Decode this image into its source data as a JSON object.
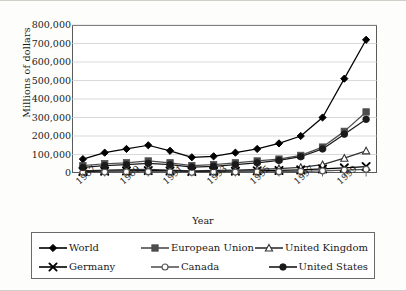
{
  "chart_data": {
    "type": "line",
    "title": "",
    "xlabel": "Year",
    "ylabel": "Millions of dollars",
    "x": [
      1987,
      1988,
      1989,
      1990,
      1991,
      1992,
      1993,
      1994,
      1995,
      1996,
      1997,
      1998,
      1999,
      2000
    ],
    "xtick_labels": [
      "1987",
      "1989",
      "1991",
      "1993",
      "1995",
      "1997",
      "1999"
    ],
    "ytick_labels": [
      "800,000",
      "700,000",
      "600,000",
      "500,000",
      "400,000",
      "300,000",
      "200,000",
      "100,000",
      "0"
    ],
    "ylim": [
      0,
      800000
    ],
    "ytick_step": 100000,
    "grid": "horizontal",
    "legend_position": "below",
    "series": [
      {
        "name": "World",
        "marker": "filled-diamond",
        "color": "#000000",
        "values": [
          75000,
          110000,
          130000,
          150000,
          120000,
          85000,
          90000,
          110000,
          130000,
          160000,
          200000,
          300000,
          510000,
          720000
        ]
      },
      {
        "name": "European Union",
        "marker": "filled-square",
        "color": "#4d4d4d",
        "values": [
          40000,
          50000,
          55000,
          65000,
          55000,
          40000,
          45000,
          55000,
          65000,
          75000,
          95000,
          140000,
          225000,
          330000
        ]
      },
      {
        "name": "United Kingdom",
        "marker": "open-triangle",
        "color": "#333333",
        "values": [
          12000,
          15000,
          18000,
          20000,
          16000,
          12000,
          14000,
          16000,
          20000,
          24000,
          30000,
          45000,
          80000,
          120000
        ]
      },
      {
        "name": "Germany",
        "marker": "cross-x",
        "color": "#000000",
        "values": [
          8000,
          10000,
          11000,
          13000,
          11000,
          8000,
          9000,
          10000,
          12000,
          14000,
          17000,
          22000,
          28000,
          35000
        ]
      },
      {
        "name": "Canada",
        "marker": "open-circle",
        "color": "#555555",
        "values": [
          4000,
          5000,
          6000,
          7000,
          6000,
          4000,
          5000,
          5000,
          6000,
          7000,
          9000,
          12000,
          16000,
          20000
        ]
      },
      {
        "name": "United States",
        "marker": "filled-circle",
        "color": "#1a1a1a",
        "values": [
          30000,
          40000,
          45000,
          52000,
          45000,
          32000,
          36000,
          45000,
          55000,
          68000,
          88000,
          130000,
          210000,
          290000
        ]
      }
    ]
  },
  "legend": {
    "entries": [
      {
        "label": "World"
      },
      {
        "label": "European Union"
      },
      {
        "label": "United Kingdom"
      },
      {
        "label": "Germany"
      },
      {
        "label": "Canada"
      },
      {
        "label": "United States"
      }
    ]
  }
}
